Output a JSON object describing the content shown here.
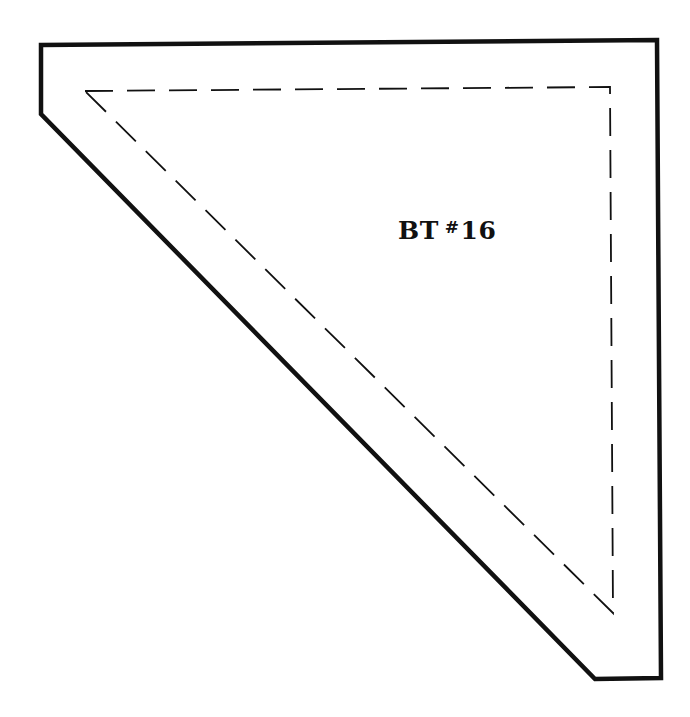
{
  "template": {
    "label_prefix": "BT",
    "label_hash": "#",
    "label_number": "16",
    "full_label": "BT #16",
    "shape": "triangle with trimmed corners (quilt template)",
    "outer_outline": {
      "style": "solid",
      "color": "#111111",
      "points": [
        [
          41,
          45
        ],
        [
          657,
          40
        ],
        [
          661,
          678
        ],
        [
          595,
          679
        ],
        [
          41,
          114
        ]
      ]
    },
    "seam_line": {
      "style": "dashed",
      "color": "#111111",
      "points": [
        [
          85,
          91
        ],
        [
          610,
          87
        ],
        [
          613,
          613
        ]
      ]
    }
  }
}
